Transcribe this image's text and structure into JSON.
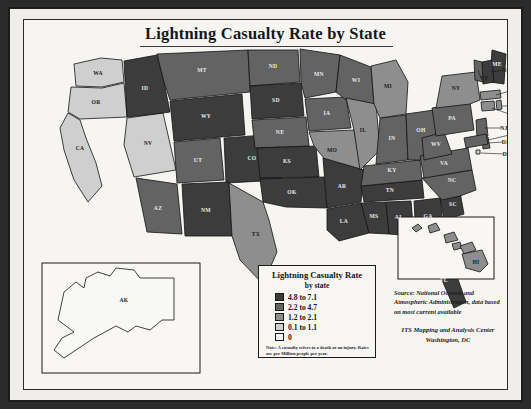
{
  "map": {
    "title": "Lightning Casualty Rate by State",
    "legend": {
      "title_line1": "Lightning Casualty Rate",
      "title_line2": "by state",
      "classes": [
        {
          "label": "4.8 to 7.1",
          "color": "#3c3c3c",
          "min": 4.8,
          "max": 7.1
        },
        {
          "label": "2.2 to 4.7",
          "color": "#636363",
          "min": 2.2,
          "max": 4.7
        },
        {
          "label": "1.2 to 2.1",
          "color": "#8e8e8e",
          "min": 1.2,
          "max": 2.1
        },
        {
          "label": "0.1 to 1.1",
          "color": "#cfcfcf",
          "min": 0.1,
          "max": 1.1
        },
        {
          "label": "0",
          "color": "#f8f8f6",
          "min": 0,
          "max": 0
        }
      ],
      "note": "Note: A casualty refers to a death or an injury. Rates are per Million people per year."
    },
    "source": "Source: National Oceanic and Atmospheric Administration, data based on most current available",
    "credit_line1": "ITS Mapping and Analysis Center",
    "credit_line2": "Washington, DC",
    "insets": [
      {
        "name": "alaska",
        "label": "AK",
        "class_index": 4
      },
      {
        "name": "hawaii",
        "label": "HI",
        "class_index": 2
      }
    ],
    "states": [
      {
        "code": "WA",
        "class_index": 3
      },
      {
        "code": "OR",
        "class_index": 3
      },
      {
        "code": "CA",
        "class_index": 3
      },
      {
        "code": "NV",
        "class_index": 3
      },
      {
        "code": "ID",
        "class_index": 0
      },
      {
        "code": "MT",
        "class_index": 1
      },
      {
        "code": "WY",
        "class_index": 0
      },
      {
        "code": "UT",
        "class_index": 1
      },
      {
        "code": "AZ",
        "class_index": 1
      },
      {
        "code": "CO",
        "class_index": 0
      },
      {
        "code": "NM",
        "class_index": 0
      },
      {
        "code": "ND",
        "class_index": 1
      },
      {
        "code": "SD",
        "class_index": 0
      },
      {
        "code": "NE",
        "class_index": 1
      },
      {
        "code": "KS",
        "class_index": 0
      },
      {
        "code": "OK",
        "class_index": 0
      },
      {
        "code": "TX",
        "class_index": 2
      },
      {
        "code": "MN",
        "class_index": 1
      },
      {
        "code": "IA",
        "class_index": 1
      },
      {
        "code": "MO",
        "class_index": 2
      },
      {
        "code": "AR",
        "class_index": 0
      },
      {
        "code": "LA",
        "class_index": 0
      },
      {
        "code": "WI",
        "class_index": 1
      },
      {
        "code": "IL",
        "class_index": 2
      },
      {
        "code": "MS",
        "class_index": 0
      },
      {
        "code": "AL",
        "class_index": 0
      },
      {
        "code": "TN",
        "class_index": 0
      },
      {
        "code": "KY",
        "class_index": 1
      },
      {
        "code": "IN",
        "class_index": 1
      },
      {
        "code": "MI",
        "class_index": 2
      },
      {
        "code": "OH",
        "class_index": 1
      },
      {
        "code": "GA",
        "class_index": 0
      },
      {
        "code": "FL",
        "class_index": 0
      },
      {
        "code": "SC",
        "class_index": 0
      },
      {
        "code": "NC",
        "class_index": 1
      },
      {
        "code": "VA",
        "class_index": 1
      },
      {
        "code": "WV",
        "class_index": 1
      },
      {
        "code": "PA",
        "class_index": 1
      },
      {
        "code": "NY",
        "class_index": 2
      },
      {
        "code": "ME",
        "class_index": 0
      },
      {
        "code": "NH",
        "class_index": 0
      },
      {
        "code": "VT",
        "class_index": 1
      },
      {
        "code": "MA",
        "class_index": 2
      },
      {
        "code": "CT",
        "class_index": 2
      },
      {
        "code": "RI",
        "class_index": 2
      },
      {
        "code": "NJ",
        "class_index": 1
      },
      {
        "code": "DE",
        "class_index": 1
      },
      {
        "code": "MD",
        "class_index": 1
      },
      {
        "code": "DC",
        "class_index": 3
      }
    ]
  }
}
